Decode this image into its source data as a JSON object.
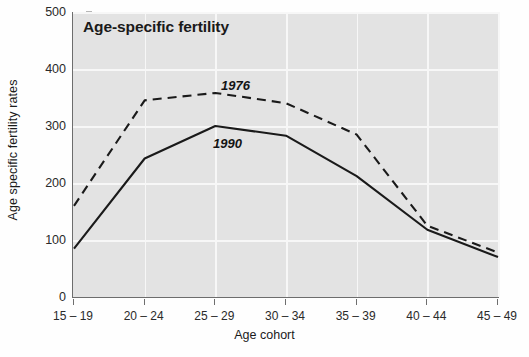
{
  "chart_data": {
    "type": "line",
    "title": "Age-specific fertility",
    "xlabel": "Age cohort",
    "ylabel": "Age specific fertility rates",
    "categories": [
      "15 – 19",
      "20 – 24",
      "25 – 29",
      "30 – 34",
      "35 – 39",
      "40 – 44",
      "45 – 49"
    ],
    "ylim": [
      0,
      500
    ],
    "yticks": [
      0,
      100,
      200,
      300,
      400,
      500
    ],
    "ytick_labels": [
      "0",
      "100",
      "200",
      "300",
      "400",
      "500"
    ],
    "grid": true,
    "legend": "inline-annotations",
    "series": [
      {
        "name": "1976",
        "style": "dashed",
        "color": "#1a1a1a",
        "label_text": "1976",
        "values": [
          160,
          345,
          358,
          340,
          285,
          125,
          78
        ]
      },
      {
        "name": "1990",
        "style": "solid",
        "color": "#1a1a1a",
        "label_text": "1990",
        "values": [
          85,
          243,
          300,
          283,
          212,
          118,
          70
        ]
      }
    ],
    "plot_background": "#e3e3e3",
    "grid_color": "#f7f7f7",
    "axis_color": "#6d6d6d"
  }
}
